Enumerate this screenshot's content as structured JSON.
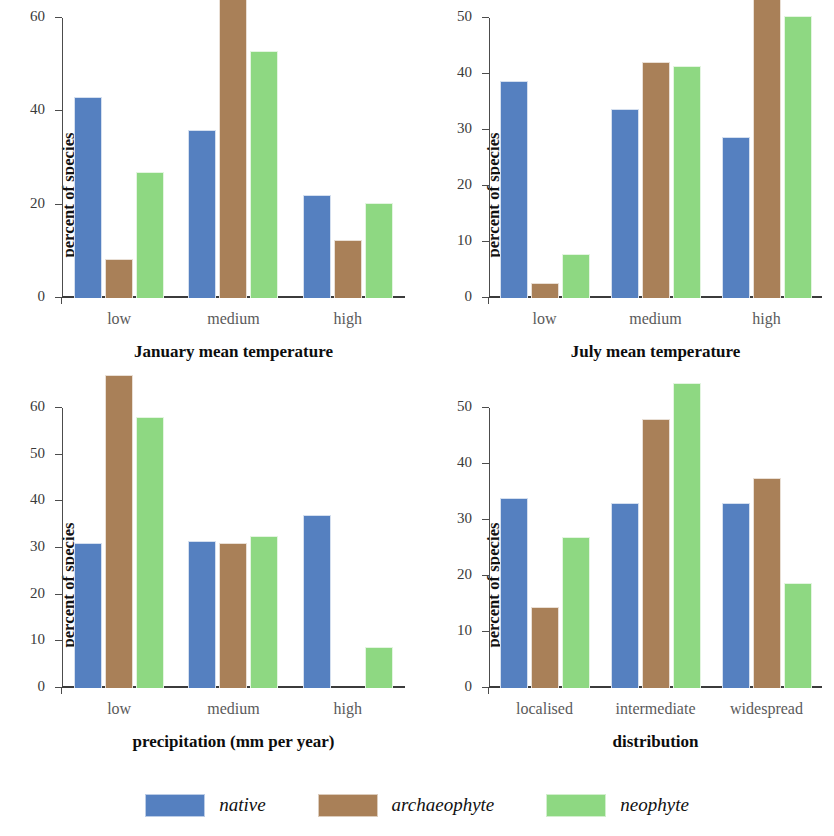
{
  "chart_data": [
    {
      "type": "bar",
      "title": "January mean temperature",
      "xlabel": "January mean temperature",
      "ylabel": "percent of species",
      "categories": [
        "low",
        "medium",
        "high"
      ],
      "ylim": [
        0,
        60
      ],
      "yticks": [
        0,
        20,
        40,
        60
      ],
      "grid": false,
      "clipped_note": "archaeophyte bar for 'medium' extends above the plotted axis top",
      "series": [
        {
          "name": "native",
          "color": "#5580c0",
          "values": [
            43,
            36,
            22
          ]
        },
        {
          "name": "archaeophyte",
          "color": "#a98058",
          "values": [
            8.3,
            80,
            12.5
          ]
        },
        {
          "name": "neophyte",
          "color": "#8ed882",
          "values": [
            27,
            53,
            20.3
          ]
        }
      ]
    },
    {
      "type": "bar",
      "title": "July mean temperature",
      "xlabel": "July mean temperature",
      "ylabel": "percent of species",
      "categories": [
        "low",
        "medium",
        "high"
      ],
      "ylim": [
        0,
        50
      ],
      "yticks": [
        0,
        10,
        20,
        30,
        40,
        50
      ],
      "grid": false,
      "clipped_note": "archaeophyte bar for 'high' extends above the plotted axis top",
      "series": [
        {
          "name": "native",
          "color": "#5580c0",
          "values": [
            38.7,
            33.8,
            28.7
          ]
        },
        {
          "name": "archaeophyte",
          "color": "#a98058",
          "values": [
            2.7,
            42.2,
            54.5
          ]
        },
        {
          "name": "neophyte",
          "color": "#8ed882",
          "values": [
            7.8,
            41.5,
            50.3
          ]
        }
      ]
    },
    {
      "type": "bar",
      "title": "precipitation (mm per year)",
      "xlabel": "precipitation (mm per year)",
      "ylabel": "percent of species",
      "categories": [
        "low",
        "medium",
        "high"
      ],
      "ylim": [
        0,
        60
      ],
      "yticks": [
        0,
        10,
        20,
        30,
        40,
        50,
        60
      ],
      "grid": false,
      "clipped_note": "archaeophyte bar for 'low' extends above the plotted axis top",
      "series": [
        {
          "name": "native",
          "color": "#5580c0",
          "values": [
            31,
            31.5,
            37
          ]
        },
        {
          "name": "archaeophyte",
          "color": "#a98058",
          "values": [
            67,
            31,
            0
          ]
        },
        {
          "name": "neophyte",
          "color": "#8ed882",
          "values": [
            58,
            32.5,
            8.7
          ]
        }
      ]
    },
    {
      "type": "bar",
      "title": "distribution",
      "xlabel": "distribution",
      "ylabel": "percent of species",
      "categories": [
        "localised",
        "intermediate",
        "widespread"
      ],
      "ylim": [
        0,
        50
      ],
      "yticks": [
        0,
        10,
        20,
        30,
        40,
        50
      ],
      "grid": false,
      "clipped_note": "neophyte bar for 'intermediate' extends above the plotted axis top",
      "series": [
        {
          "name": "native",
          "color": "#5580c0",
          "values": [
            34,
            33,
            33
          ]
        },
        {
          "name": "archaeophyte",
          "color": "#a98058",
          "values": [
            14.5,
            48,
            37.5
          ]
        },
        {
          "name": "neophyte",
          "color": "#8ed882",
          "values": [
            27,
            54.5,
            18.8
          ]
        }
      ]
    }
  ],
  "legend": {
    "position": "bottom-center",
    "items": [
      {
        "label": "native",
        "color": "#5580c0"
      },
      {
        "label": "archaeophyte",
        "color": "#a98058"
      },
      {
        "label": "neophyte",
        "color": "#8ed882"
      }
    ]
  }
}
